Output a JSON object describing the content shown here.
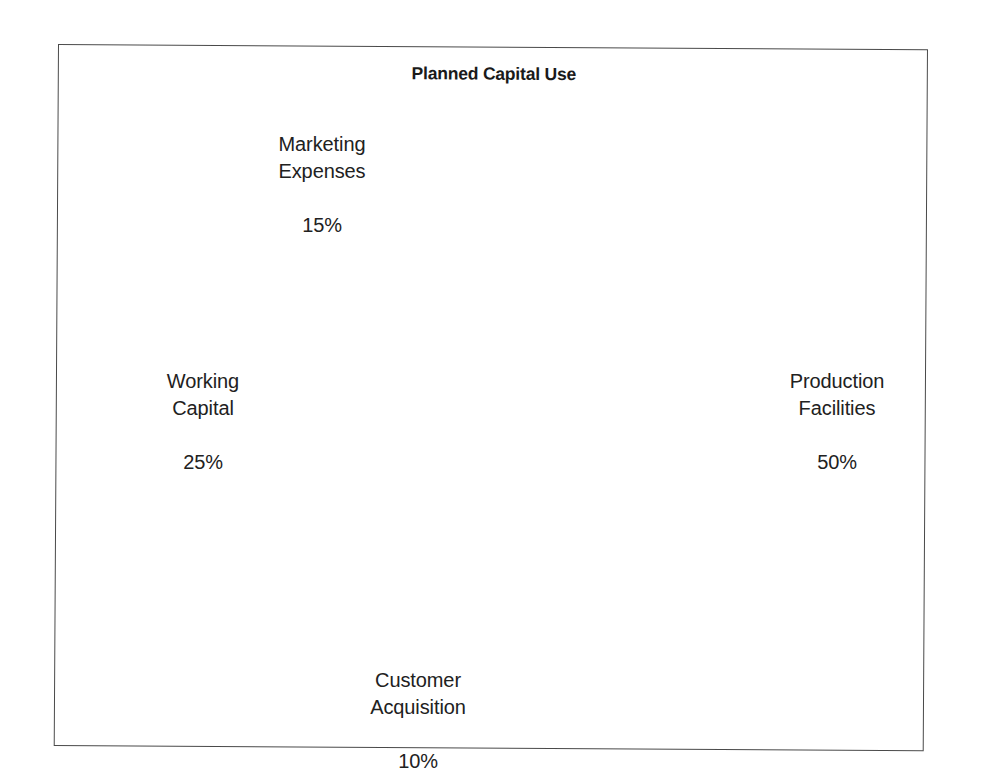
{
  "figure": {
    "title": "Planned Capital Use",
    "background_color": "#ffffff",
    "frame_color": "#4a4a4a"
  },
  "chart_data": {
    "type": "pie",
    "title": "Planned Capital Use",
    "xlabel": "",
    "ylabel": "",
    "grid": false,
    "legend": "none",
    "label_format": "name + percent",
    "start_angle_deg": -90,
    "direction": "counterclockwise",
    "categories": [
      "Production Facilities",
      "Marketing Expenses",
      "Working Capital",
      "Customer Acquisition"
    ],
    "values": [
      50,
      25,
      15,
      10
    ],
    "slices": [
      {
        "label": "Production Facilities",
        "value": 50,
        "percent_text": "50%",
        "color": "#0d0d0d",
        "exploded": false,
        "explode_offset": 0,
        "start_deg": -90,
        "end_deg": 90
      },
      {
        "label": "Marketing Expenses",
        "value": 15,
        "percent_text": "15%",
        "color": "#787878",
        "exploded": true,
        "explode_offset": 16,
        "start_deg": -144,
        "end_deg": -90
      },
      {
        "label": "Working Capital",
        "value": 25,
        "percent_text": "25%",
        "color": "#acacac",
        "exploded": true,
        "explode_offset": 16,
        "start_deg": -234,
        "end_deg": -144
      },
      {
        "label": "Customer Acquisition",
        "value": 10,
        "percent_text": "10%",
        "color": "#e2e2e2",
        "exploded": true,
        "explode_offset": 16,
        "start_deg": -270,
        "end_deg": -234
      }
    ]
  },
  "labels": {
    "marketing": {
      "name": "Marketing\nExpenses",
      "value": "15%"
    },
    "working": {
      "name": "Working\nCapital",
      "value": "25%"
    },
    "customer": {
      "name": "Customer\nAcquisition",
      "value": "10%"
    },
    "production": {
      "name": "Production\nFacilities",
      "value": "50%"
    }
  }
}
